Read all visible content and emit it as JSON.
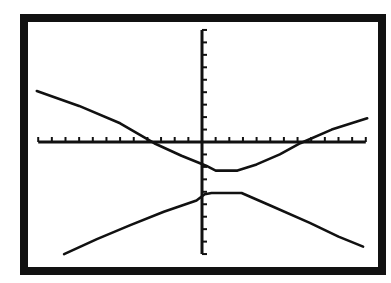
{
  "window": {
    "frame_color": "#111111",
    "background": "#ffffff",
    "ink_color": "#111111"
  },
  "chart_data": {
    "type": "line",
    "title": "",
    "xlabel": "",
    "ylabel": "",
    "xlim": [
      -12,
      12
    ],
    "ylim": [
      -9,
      9
    ],
    "x_tick_step": 1,
    "y_tick_step": 1,
    "grid": false,
    "legend": null,
    "series": [
      {
        "name": "upper-branch",
        "points": [
          [
            -12.1,
            4.1
          ],
          [
            -9.0,
            2.9
          ],
          [
            -6.0,
            1.5
          ],
          [
            -3.5,
            -0.1
          ],
          [
            -1.5,
            -1.1
          ],
          [
            -0.15,
            -1.7
          ],
          [
            0.3,
            -1.9
          ],
          [
            1.0,
            -2.3
          ],
          [
            2.6,
            -2.3
          ],
          [
            4.0,
            -1.8
          ],
          [
            5.7,
            -1.0
          ],
          [
            7.2,
            -0.1
          ],
          [
            9.5,
            1.0
          ],
          [
            12.1,
            1.9
          ]
        ]
      },
      {
        "name": "lower-branch",
        "points": [
          [
            -10.1,
            -9.0
          ],
          [
            -7.7,
            -7.8
          ],
          [
            -5.3,
            -6.7
          ],
          [
            -2.8,
            -5.6
          ],
          [
            -0.4,
            -4.7
          ],
          [
            0.2,
            -4.2
          ],
          [
            0.7,
            -4.1
          ],
          [
            2.9,
            -4.1
          ],
          [
            5.0,
            -5.1
          ],
          [
            7.9,
            -6.5
          ],
          [
            10.0,
            -7.6
          ],
          [
            11.8,
            -8.4
          ]
        ]
      }
    ]
  }
}
